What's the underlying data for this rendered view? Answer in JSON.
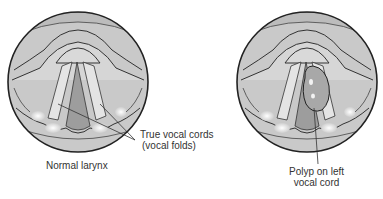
{
  "figures": [
    {
      "id": "normal",
      "caption": "Normal larynx",
      "callout": {
        "line1": "True vocal cords",
        "line2": "(vocal folds)"
      }
    },
    {
      "id": "polyp",
      "callout": {
        "line1": "Polyp on left",
        "line2": "vocal cord"
      }
    }
  ],
  "colors": {
    "outline": "#222222",
    "tissue_light": "#d4d4d4",
    "tissue_mid": "#bdbdbd",
    "tissue_dark": "#9a9a9a",
    "cord": "#e2e2e2",
    "highlight": "#f4f4f4",
    "text": "#333333"
  }
}
